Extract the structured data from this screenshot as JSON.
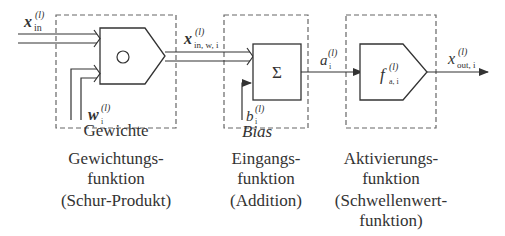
{
  "diagram": {
    "blocks": [
      {
        "id": "weighting",
        "operator_symbol": "○",
        "inner_label": "Gewichte",
        "weight_symbol": {
          "main": "w",
          "sup": "(l)",
          "sub": "i"
        },
        "caption_lines": [
          "Gewichtungs-",
          "funktion",
          "(Schur-Produkt)"
        ]
      },
      {
        "id": "input",
        "operator_symbol": "Σ",
        "inner_label": "Bias",
        "bias_symbol": {
          "main": "b",
          "sup": "(l)",
          "sub": "i"
        },
        "caption_lines": [
          "Eingangs-",
          "funktion",
          "(Addition)"
        ]
      },
      {
        "id": "activation",
        "operator_symbol": {
          "main": "f",
          "sup": "(l)",
          "sub": "a, i"
        },
        "caption_lines": [
          "Aktivierungs-",
          "funktion",
          "(Schwellenwert-",
          "funktion)"
        ]
      }
    ],
    "signals": {
      "input": {
        "main": "x",
        "sup": "(l)",
        "sub": "in"
      },
      "weighted": {
        "main": "x",
        "sup": "(l)",
        "sub": "in, w, i"
      },
      "activation": {
        "main": "a",
        "sup": "(l)",
        "sub": "i"
      },
      "output": {
        "main": "x",
        "sup": "(l)",
        "sub": "out, i"
      }
    },
    "colors": {
      "line": "#333333",
      "dashed": "#555555",
      "background": "#ffffff"
    }
  }
}
